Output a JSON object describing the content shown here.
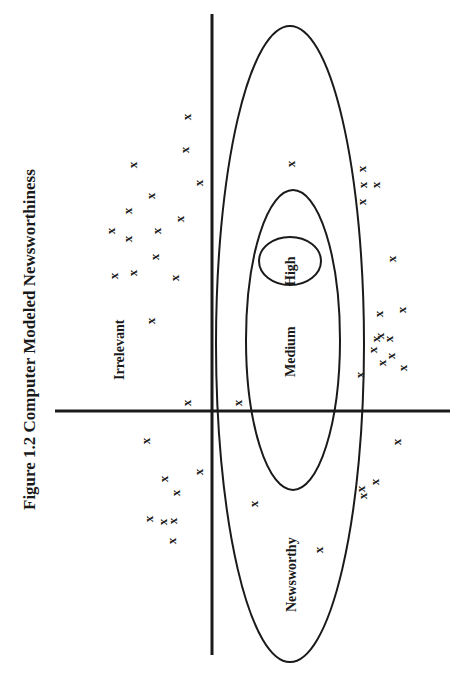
{
  "figure": {
    "title": "Figure 1.2  Computer Modeled Newsworthiness",
    "orientation": "rotated-90-ccw",
    "axes": {
      "horizontal": {
        "x1": 55,
        "y1": 411,
        "x2": 450,
        "y2": 411
      },
      "vertical": {
        "x1": 212,
        "y1": 14,
        "x2": 212,
        "y2": 655
      }
    },
    "regions": [
      {
        "name": "Newsworthy",
        "cx": 290,
        "cy": 344,
        "rx": 74,
        "ry": 318
      },
      {
        "name": "Medium",
        "cx": 293,
        "cy": 340,
        "rx": 47,
        "ry": 150
      },
      {
        "name": "High",
        "cx": 290,
        "cy": 261,
        "rx": 31,
        "ry": 24
      }
    ],
    "labels": {
      "irrelevant": "Irrelevant",
      "newsworthy": "Newsworthy",
      "medium": "Medium",
      "high": "High"
    },
    "mark_glyph": "x",
    "marks": [
      [
        186,
        118
      ],
      [
        184,
        151
      ],
      [
        132,
        166
      ],
      [
        198,
        184
      ],
      [
        150,
        197
      ],
      [
        127,
        212
      ],
      [
        179,
        220
      ],
      [
        110,
        232
      ],
      [
        156,
        232
      ],
      [
        127,
        240
      ],
      [
        113,
        277
      ],
      [
        154,
        258
      ],
      [
        174,
        279
      ],
      [
        132,
        274
      ],
      [
        150,
        322
      ],
      [
        186,
        404
      ],
      [
        237,
        404
      ],
      [
        145,
        442
      ],
      [
        198,
        473
      ],
      [
        163,
        480
      ],
      [
        148,
        520
      ],
      [
        175,
        494
      ],
      [
        172,
        522
      ],
      [
        162,
        523
      ],
      [
        171,
        542
      ],
      [
        290,
        165
      ],
      [
        361,
        170
      ],
      [
        362,
        186
      ],
      [
        375,
        186
      ],
      [
        361,
        203
      ],
      [
        391,
        260
      ],
      [
        378,
        315
      ],
      [
        401,
        311
      ],
      [
        379,
        337
      ],
      [
        375,
        340
      ],
      [
        388,
        340
      ],
      [
        372,
        351
      ],
      [
        390,
        357
      ],
      [
        381,
        364
      ],
      [
        402,
        369
      ],
      [
        359,
        376
      ],
      [
        396,
        443
      ],
      [
        360,
        490
      ],
      [
        362,
        497
      ],
      [
        374,
        483
      ],
      [
        253,
        505
      ],
      [
        318,
        551
      ]
    ]
  }
}
